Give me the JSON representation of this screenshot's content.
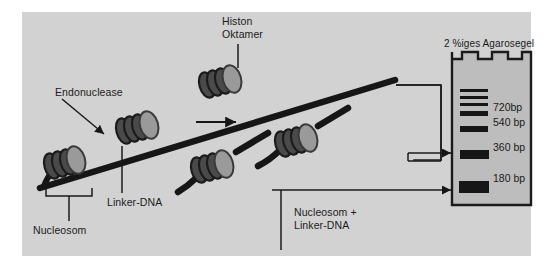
{
  "figure": {
    "panel_background": "#d2d2d2",
    "page_background": "#ffffff"
  },
  "labels": {
    "histon_oktamer": "Histon\nOktamer",
    "endonuclease": "Endonuclease",
    "linker_dna": "Linker-DNA",
    "nucleosom": "Nucleosom",
    "nucleosom_plus_linker": "Nucleosom +\nLinker-DNA",
    "gel_title": "2 %iges Agarosegel"
  },
  "gel": {
    "title": "2 %iges Agarosegel",
    "well_count": 3,
    "body_color": "#bdbdbd",
    "border_color": "#1b1b1b",
    "band_color": "#161616",
    "bands": [
      {
        "label": "",
        "size_bp": null,
        "thickness": 3,
        "y": 90
      },
      {
        "label": "",
        "size_bp": null,
        "thickness": 3,
        "y": 97
      },
      {
        "label": "",
        "size_bp": null,
        "thickness": 3,
        "y": 104
      },
      {
        "label": "720bp",
        "size_bp": 720,
        "thickness": 5,
        "y": 112
      },
      {
        "label": "540 bp",
        "size_bp": 540,
        "thickness": 6,
        "y": 127
      },
      {
        "label": "360 bp",
        "size_bp": 360,
        "thickness": 9,
        "y": 152
      },
      {
        "label": "180 bp",
        "size_bp": 180,
        "thickness": 12,
        "y": 183
      }
    ],
    "band_labels": [
      {
        "text": "720bp",
        "y": 107
      },
      {
        "text": "540 bp",
        "y": 122
      },
      {
        "text": "360 bp",
        "y": 147
      },
      {
        "text": "180 bp",
        "y": 178
      }
    ]
  },
  "diagram": {
    "nucleosome_fill": "#9a9a9a",
    "nucleosome_edge": "#5e5e5e",
    "dna_color": "#161616",
    "arrow_color": "#161616",
    "chain_top_label": "Histon Oktamer",
    "process_arrow": "right-arrow"
  }
}
